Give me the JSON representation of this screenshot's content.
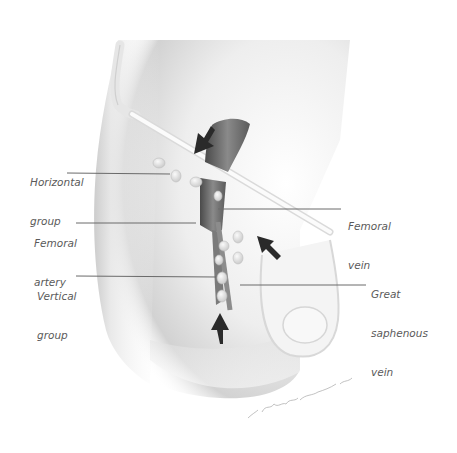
{
  "figure": {
    "colors": {
      "background": "#ffffff",
      "skin_shadow": "#c8c8c8",
      "vessel_dark": "#5c5c5c",
      "node_fill": "#efefef",
      "arrow": "#2a2a2a",
      "label_text": "#5a5a5a",
      "leader_line": "#6a6a6a"
    }
  },
  "labels": {
    "horizontal_group": {
      "line1": "Horizontal",
      "line2": "group"
    },
    "femoral_artery": {
      "line1": "Femoral",
      "line2": "artery"
    },
    "vertical_group": {
      "line1": "Vertical",
      "line2": "group"
    },
    "femoral_vein": {
      "line1": "Femoral",
      "line2": "vein"
    },
    "great_saphenous_vein": {
      "line1": "Great",
      "line2": "saphenous",
      "line3": "vein"
    }
  },
  "signature": {
    "text": "S. Shipway Bauman"
  }
}
